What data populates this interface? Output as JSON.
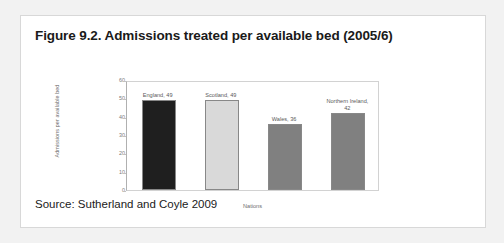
{
  "figure": {
    "title": "Figure 9.2. Admissions treated per available bed (2005/6)",
    "source": "Source: Sutherland and Coyle 2009"
  },
  "chart_data": {
    "type": "bar",
    "title": "Admissions treated per available bed (2005/6)",
    "xlabel": "Nations",
    "ylabel": "Admissions per available bed",
    "categories": [
      "England",
      "Scotland",
      "Wales",
      "Northern Ireland"
    ],
    "values": [
      49,
      49,
      36,
      42
    ],
    "point_labels": [
      "England, 49",
      "Scotland, 49",
      "Wales, 36",
      "Northern Ireland, 42"
    ],
    "ylim": [
      0,
      60
    ],
    "yticks": [
      0,
      10,
      20,
      30,
      40,
      50,
      60
    ],
    "ytick_labels": [
      "0",
      "10",
      "20",
      "30",
      "40",
      "50",
      "60"
    ],
    "grid": false,
    "legend": "none",
    "bar_colors": [
      "#1f1f1f",
      "#d9d9d9",
      "#808080",
      "#808080"
    ],
    "bar_border_color": "#888888"
  }
}
